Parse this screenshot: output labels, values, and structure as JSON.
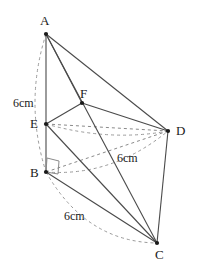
{
  "figure": {
    "stroke_color": "#4a4a4a",
    "dashed_color": "#8a8a8a",
    "text_color": "#1a1a1a",
    "background": "#ffffff",
    "width": 198,
    "height": 276
  },
  "vertices": [
    {
      "id": "A",
      "label": "A",
      "x": 46,
      "y": 34,
      "label_x": 40,
      "label_y": 14
    },
    {
      "id": "B",
      "label": "B",
      "x": 46,
      "y": 172,
      "label_x": 30,
      "label_y": 166
    },
    {
      "id": "C",
      "label": "C",
      "x": 157,
      "y": 243,
      "label_x": 155,
      "label_y": 248
    },
    {
      "id": "D",
      "label": "D",
      "x": 168,
      "y": 131,
      "label_x": 176,
      "label_y": 124
    },
    {
      "id": "E",
      "label": "E",
      "x": 46,
      "y": 124,
      "label_x": 30,
      "label_y": 117
    },
    {
      "id": "F",
      "label": "F",
      "x": 82,
      "y": 103,
      "label_x": 80,
      "label_y": 87
    }
  ],
  "solid_edges": [
    {
      "name": "edge-A-B",
      "from": "A",
      "to": "B"
    },
    {
      "name": "edge-A-D",
      "from": "A",
      "to": "D"
    },
    {
      "name": "edge-A-C",
      "from": "A",
      "to": "C"
    },
    {
      "name": "edge-A-F",
      "from": "A",
      "to": "F"
    },
    {
      "name": "edge-E-F",
      "from": "E",
      "to": "F"
    },
    {
      "name": "edge-F-D",
      "from": "F",
      "to": "D"
    },
    {
      "name": "edge-E-B",
      "from": "E",
      "to": "B"
    },
    {
      "name": "edge-E-C",
      "from": "E",
      "to": "C"
    },
    {
      "name": "edge-B-C",
      "from": "B",
      "to": "C"
    },
    {
      "name": "edge-D-C",
      "from": "D",
      "to": "C"
    }
  ],
  "dashed_edges": [
    {
      "name": "edge-E-D-hidden",
      "from": "E",
      "to": "D"
    },
    {
      "name": "edge-B-D-hidden",
      "from": "B",
      "to": "D"
    }
  ],
  "arcs": [
    {
      "name": "arc-A-B",
      "from": "A",
      "to": "B",
      "bulge": -22
    },
    {
      "name": "arc-B-C",
      "from": "B",
      "to": "C",
      "bulge": -20
    },
    {
      "name": "arc-B-D",
      "from": "B",
      "to": "D",
      "bulge": -14
    },
    {
      "name": "arc-E-D",
      "from": "E",
      "to": "D",
      "bulge": 13
    }
  ],
  "right_angle": {
    "name": "right-angle-marker-B",
    "at": "B",
    "points": "46,172 47,158 59,161 58,174"
  },
  "measurements": [
    {
      "name": "measure-AB",
      "text": "6cm",
      "x": 13,
      "y": 97
    },
    {
      "name": "measure-BD",
      "text": "6cm",
      "x": 117,
      "y": 152
    },
    {
      "name": "measure-BC",
      "text": "6cm",
      "x": 64,
      "y": 210
    }
  ]
}
